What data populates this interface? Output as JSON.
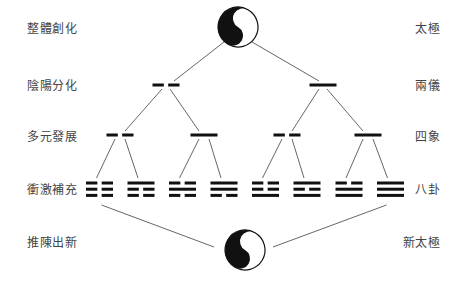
{
  "labels_left": [
    {
      "text": "整體創化",
      "y": 22
    },
    {
      "text": "陰陽分化",
      "y": 79
    },
    {
      "text": "多元發展",
      "y": 130
    },
    {
      "text": "衝激補充",
      "y": 183
    },
    {
      "text": "推陳出新",
      "y": 236
    }
  ],
  "labels_right": [
    {
      "text": "太極",
      "y": 22
    },
    {
      "text": "兩儀",
      "y": 79
    },
    {
      "text": "四象",
      "y": 130
    },
    {
      "text": "八卦",
      "y": 183
    },
    {
      "text": "新太極",
      "y": 236
    }
  ],
  "colors": {
    "ink": "#111111",
    "line": "#555555",
    "text": "#444444",
    "background": "#ffffff"
  },
  "taiji_top": {
    "name": "taiji",
    "cx": 238,
    "cy": 27,
    "r": 20
  },
  "taiji_bottom": {
    "name": "new-taiji",
    "cx": 245,
    "cy": 250,
    "r": 20
  },
  "two_modes": [
    {
      "name": "yin",
      "cx": 166,
      "y": 85,
      "type": "broken"
    },
    {
      "name": "yang",
      "cx": 323,
      "y": 85,
      "type": "solid"
    }
  ],
  "four_images": [
    {
      "name": "greater-yin",
      "cx": 120,
      "y": 135,
      "type": "broken"
    },
    {
      "name": "lesser-yang",
      "cx": 204,
      "y": 135,
      "type": "solid"
    },
    {
      "name": "lesser-yin",
      "cx": 287,
      "y": 135,
      "type": "broken"
    },
    {
      "name": "greater-yang",
      "cx": 368,
      "y": 135,
      "type": "solid"
    }
  ],
  "eight_trigrams": [
    {
      "name": "kun",
      "symbol": "☷",
      "cx": 99.5,
      "lines": [
        "yin",
        "yin",
        "yin"
      ]
    },
    {
      "name": "gen",
      "symbol": "☶",
      "cx": 141,
      "lines": [
        "yang",
        "yin",
        "yin"
      ]
    },
    {
      "name": "kan",
      "symbol": "☵",
      "cx": 182.5,
      "lines": [
        "yin",
        "yang",
        "yin"
      ]
    },
    {
      "name": "xun",
      "symbol": "☴",
      "cx": 224,
      "lines": [
        "yang",
        "yang",
        "yin"
      ]
    },
    {
      "name": "zhen",
      "symbol": "☳",
      "cx": 265.5,
      "lines": [
        "yin",
        "yin",
        "yang"
      ]
    },
    {
      "name": "li",
      "symbol": "☲",
      "cx": 307,
      "lines": [
        "yang",
        "yin",
        "yang"
      ]
    },
    {
      "name": "dui",
      "symbol": "☱",
      "cx": 349,
      "lines": [
        "yin",
        "yang",
        "yang"
      ]
    },
    {
      "name": "qian",
      "symbol": "☰",
      "cx": 390.5,
      "lines": [
        "yang",
        "yang",
        "yang"
      ]
    }
  ]
}
